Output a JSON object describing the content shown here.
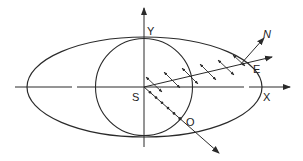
{
  "diagram": {
    "labels": {
      "y_axis": "Y",
      "x_axis": "X",
      "origin": "S",
      "extraordinary_point": "E",
      "normal": "N",
      "ordinary_point": "O"
    },
    "colors": {
      "stroke": "#2a2a2a",
      "background": "#ffffff"
    }
  }
}
